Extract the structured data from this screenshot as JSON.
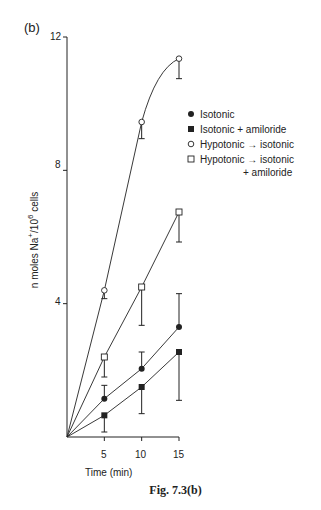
{
  "panel_label": "(b)",
  "caption": "Fig. 7.3(b)",
  "chart_data": {
    "type": "line",
    "title": "",
    "xlabel": "Time (min)",
    "ylabel_parts": {
      "pre": "n moles Na",
      "sup1": "+",
      "mid": "/10",
      "sup2": "6",
      "post": " cells"
    },
    "ylabel": "n moles Na+/10^6 cells",
    "x": [
      5,
      10,
      15
    ],
    "x_ticks": [
      "5",
      "10",
      "15"
    ],
    "y_ticks": [
      "4",
      "8",
      "12"
    ],
    "xlim": [
      0,
      15
    ],
    "ylim": [
      0,
      12
    ],
    "grid": false,
    "legend_position": "right",
    "series": [
      {
        "name": "Isotonic",
        "marker": "filled-circle",
        "values": [
          1.15,
          2.05,
          3.3
        ],
        "err_low": [
          0,
          0,
          0
        ],
        "err_high": [
          0.4,
          0.5,
          1.0
        ]
      },
      {
        "name": "Isotonic + amiloride",
        "marker": "filled-square",
        "values": [
          0.65,
          1.5,
          2.55
        ],
        "err_low": [
          0.5,
          0.8,
          1.45
        ],
        "err_high": [
          0,
          0,
          0
        ]
      },
      {
        "name": "Hypotonic → isotonic",
        "marker": "open-circle",
        "values": [
          4.4,
          9.45,
          11.35
        ],
        "err_low": [
          0.25,
          0.5,
          0.6
        ],
        "err_high": [
          0,
          0,
          0
        ]
      },
      {
        "name": "Hypotonic → isotonic + amiloride",
        "marker": "open-square",
        "values": [
          2.4,
          4.5,
          6.75
        ],
        "err_low": [
          0.6,
          1.15,
          0.9
        ],
        "err_high": [
          0,
          0,
          0
        ]
      }
    ]
  },
  "legend": {
    "items": [
      {
        "label": "Isotonic"
      },
      {
        "label": "Isotonic + amiloride"
      },
      {
        "label": "Hypotonic → isotonic"
      },
      {
        "label": "Hypotonic → isotonic",
        "continuation": "+ amiloride"
      }
    ]
  }
}
